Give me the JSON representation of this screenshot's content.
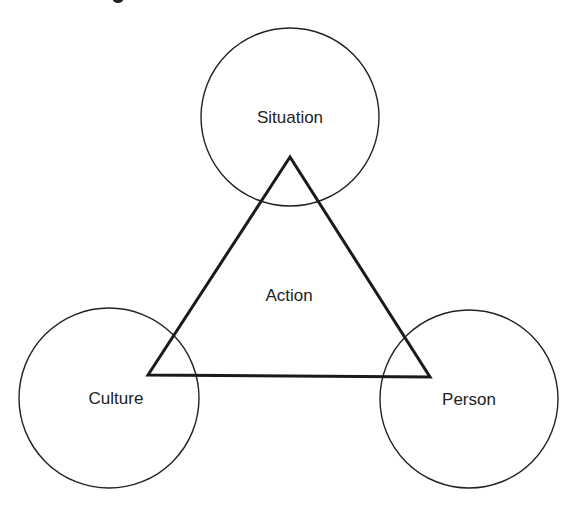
{
  "diagram": {
    "type": "triangle-with-corner-circles",
    "colors": {
      "stroke": "#222222",
      "text": "#222222",
      "background": "#ffffff"
    },
    "center_label": {
      "text": "Action",
      "x": 289,
      "y": 296
    },
    "circles": [
      {
        "id": "situation",
        "label": "Situation",
        "cx": 290,
        "cy": 117,
        "r": 89
      },
      {
        "id": "culture",
        "label": "Culture",
        "cx": 109,
        "cy": 398,
        "r": 90
      },
      {
        "id": "person",
        "label": "Person",
        "cx": 469,
        "cy": 399,
        "r": 89
      }
    ],
    "triangle": {
      "vertices": [
        [
          290,
          157
        ],
        [
          148,
          375
        ],
        [
          430,
          377
        ]
      ],
      "stroke_width": 3
    },
    "label_positions": {
      "situation": {
        "x": 290,
        "y": 118
      },
      "culture": {
        "x": 116,
        "y": 399
      },
      "person": {
        "x": 469,
        "y": 400
      }
    }
  }
}
